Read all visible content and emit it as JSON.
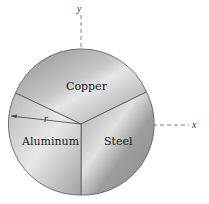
{
  "diagram": {
    "type": "disk-composed-of-three-sectors",
    "axes": {
      "y_label": "y",
      "x_label": "x"
    },
    "sectors": [
      {
        "label": "Copper",
        "color": "#a9a9a9"
      },
      {
        "label": "Steel",
        "color": "#9a9a9a"
      },
      {
        "label": "Aluminum",
        "color": "#bdbdbd"
      }
    ],
    "radius_label": "r",
    "colors": {
      "outline": "#555555",
      "axis": "#666666"
    }
  }
}
